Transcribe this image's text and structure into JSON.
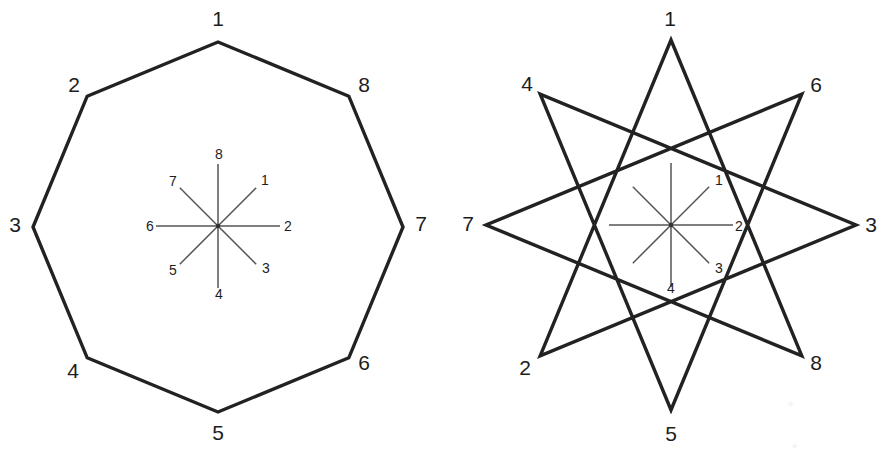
{
  "page": {
    "background_color": "#ffffff",
    "line_color": "#222222",
    "spoke_color": "#555555",
    "label_color": "#1d1d1d",
    "width": 884,
    "height": 453
  },
  "figures": [
    {
      "id": "left-figure",
      "name": "regular-octagon",
      "type": "polygon",
      "center": {
        "x": 218,
        "y": 227
      },
      "radius": 185,
      "vertex_count": 8,
      "step": 1,
      "start_angle_deg": -90,
      "direction": "clockwise",
      "vertices": [
        {
          "label": "1",
          "angle_deg": -90,
          "label_x": 218,
          "label_y": 18
        },
        {
          "label": "8",
          "angle_deg": -45,
          "label_x": 364,
          "label_y": 84
        },
        {
          "label": "7",
          "angle_deg": 0,
          "label_x": 421,
          "label_y": 223
        },
        {
          "label": "6",
          "angle_deg": 45,
          "label_x": 364,
          "label_y": 362
        },
        {
          "label": "5",
          "angle_deg": 90,
          "label_x": 218,
          "label_y": 432
        },
        {
          "label": "4",
          "angle_deg": 135,
          "label_x": 73,
          "label_y": 370
        },
        {
          "label": "3",
          "angle_deg": 180,
          "label_x": 15,
          "label_y": 224
        },
        {
          "label": "2",
          "angle_deg": -135,
          "label_x": 74,
          "label_y": 84
        }
      ],
      "inner_star": {
        "name": "eight-spoke-asterisk",
        "center": {
          "x": 218,
          "y": 226
        },
        "arm_radius_axial": 62,
        "arm_radius_diagonal": 54,
        "spokes": [
          {
            "label": "8",
            "angle_deg": -90,
            "label_x": 219,
            "label_y": 154
          },
          {
            "label": "1",
            "angle_deg": -45,
            "label_x": 265,
            "label_y": 180
          },
          {
            "label": "2",
            "angle_deg": 0,
            "label_x": 288,
            "label_y": 226
          },
          {
            "label": "3",
            "angle_deg": 45,
            "label_x": 266,
            "label_y": 268
          },
          {
            "label": "4",
            "angle_deg": 90,
            "label_x": 219,
            "label_y": 294
          },
          {
            "label": "5",
            "angle_deg": 135,
            "label_x": 173,
            "label_y": 270
          },
          {
            "label": "6",
            "angle_deg": 180,
            "label_x": 150,
            "label_y": 226
          },
          {
            "label": "7",
            "angle_deg": -135,
            "label_x": 173,
            "label_y": 181
          }
        ]
      }
    },
    {
      "id": "right-figure",
      "name": "star-polygon-8-3",
      "type": "star-polygon",
      "schlafli": "{8/3}",
      "center": {
        "x": 671,
        "y": 225
      },
      "radius": 185,
      "vertex_count": 8,
      "step": 3,
      "start_angle_deg": -90,
      "direction": "clockwise",
      "vertices": [
        {
          "label": "1",
          "angle_deg": -90,
          "label_x": 670,
          "label_y": 18
        },
        {
          "label": "6",
          "angle_deg": -45,
          "label_x": 816,
          "label_y": 84
        },
        {
          "label": "3",
          "angle_deg": 0,
          "label_x": 871,
          "label_y": 224
        },
        {
          "label": "8",
          "angle_deg": 45,
          "label_x": 816,
          "label_y": 362
        },
        {
          "label": "5",
          "angle_deg": 90,
          "label_x": 671,
          "label_y": 433
        },
        {
          "label": "2",
          "angle_deg": 135,
          "label_x": 525,
          "label_y": 367
        },
        {
          "label": "7",
          "angle_deg": 180,
          "label_x": 468,
          "label_y": 223
        },
        {
          "label": "4",
          "angle_deg": -135,
          "label_x": 527,
          "label_y": 83
        }
      ],
      "inner_star": {
        "name": "eight-spoke-asterisk",
        "center": {
          "x": 671,
          "y": 225
        },
        "arm_radius_axial": 62,
        "arm_radius_diagonal": 54,
        "spokes": [
          {
            "label": "",
            "angle_deg": -90,
            "label_x": 0,
            "label_y": 0
          },
          {
            "label": "1",
            "angle_deg": -45,
            "label_x": 719,
            "label_y": 180
          },
          {
            "label": "2",
            "angle_deg": 0,
            "label_x": 739,
            "label_y": 226
          },
          {
            "label": "3",
            "angle_deg": 45,
            "label_x": 719,
            "label_y": 268
          },
          {
            "label": "4",
            "angle_deg": 90,
            "label_x": 671,
            "label_y": 288
          },
          {
            "label": "",
            "angle_deg": 135,
            "label_x": 0,
            "label_y": 0
          },
          {
            "label": "",
            "angle_deg": 180,
            "label_x": 0,
            "label_y": 0
          },
          {
            "label": "",
            "angle_deg": -135,
            "label_x": 0,
            "label_y": 0
          }
        ]
      }
    }
  ]
}
